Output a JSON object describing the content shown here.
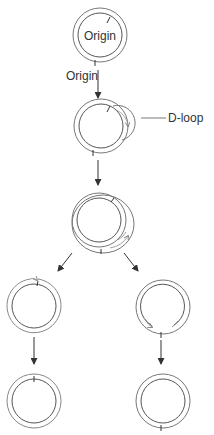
{
  "diagram": {
    "type": "mitochondrial DNA D-loop replication",
    "labels": {
      "origin_inner": "Origin",
      "origin_outer": "Origin",
      "dloop": "D-loop"
    },
    "stages": [
      {
        "name": "parent-circle",
        "cx": 100,
        "cy": 35
      },
      {
        "name": "d-loop-circle",
        "cx": 101,
        "cy": 126
      },
      {
        "name": "replicating-circle",
        "cx": 100,
        "cy": 222
      },
      {
        "name": "left-daughter-intermediate",
        "cx": 34,
        "cy": 306
      },
      {
        "name": "right-daughter-intermediate",
        "cx": 163,
        "cy": 307
      },
      {
        "name": "left-daughter-final",
        "cx": 34,
        "cy": 401
      },
      {
        "name": "right-daughter-final",
        "cx": 163,
        "cy": 401
      }
    ],
    "colors": {
      "outer_strand": "#777777",
      "inner_strand": "#444444",
      "arrow": "#333333"
    }
  }
}
